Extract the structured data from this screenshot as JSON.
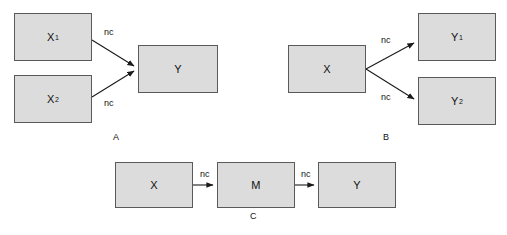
{
  "figure": {
    "background_color": "#ffffff",
    "node_fill": "#dcdcdc",
    "node_border": "#5a5a5a",
    "arrow_color": "#1a1a1a",
    "width": 507,
    "height": 235
  },
  "panels": [
    {
      "id": "A",
      "label": "A",
      "label_x": 113,
      "label_y": 132,
      "description": "two exposures converge on one outcome",
      "nodes": [
        {
          "id": "x1",
          "base": "X",
          "sub": "1",
          "x": 14,
          "y": 13,
          "w": 78,
          "h": 48
        },
        {
          "id": "x2",
          "base": "X",
          "sub": "2",
          "x": 14,
          "y": 75,
          "w": 78,
          "h": 48
        },
        {
          "id": "y",
          "base": "Y",
          "sub": "",
          "x": 138,
          "y": 45,
          "w": 80,
          "h": 48
        }
      ],
      "edges": [
        {
          "from": "x1",
          "to": "y",
          "label": "nc",
          "label_x": 104,
          "label_y": 27
        },
        {
          "from": "x2",
          "to": "y",
          "label": "nc",
          "label_x": 104,
          "label_y": 98
        }
      ]
    },
    {
      "id": "B",
      "label": "B",
      "label_x": 383,
      "label_y": 132,
      "description": "one exposure diverges to two outcomes",
      "nodes": [
        {
          "id": "x",
          "base": "X",
          "sub": "",
          "x": 288,
          "y": 45,
          "w": 78,
          "h": 48
        },
        {
          "id": "y1",
          "base": "Y",
          "sub": "1",
          "x": 418,
          "y": 13,
          "w": 78,
          "h": 48
        },
        {
          "id": "y2",
          "base": "Y",
          "sub": "2",
          "x": 418,
          "y": 77,
          "w": 78,
          "h": 48
        }
      ],
      "edges": [
        {
          "from": "x",
          "to": "y1",
          "label": "nc",
          "label_x": 381,
          "label_y": 35
        },
        {
          "from": "x",
          "to": "y2",
          "label": "nc",
          "label_x": 381,
          "label_y": 92
        }
      ]
    },
    {
      "id": "C",
      "label": "C",
      "label_x": 250,
      "label_y": 211,
      "description": "exposure acts through a mediator on the outcome",
      "nodes": [
        {
          "id": "x",
          "base": "X",
          "sub": "",
          "x": 115,
          "y": 162,
          "w": 78,
          "h": 46
        },
        {
          "id": "m",
          "base": "M",
          "sub": "",
          "x": 217,
          "y": 162,
          "w": 78,
          "h": 46
        },
        {
          "id": "y",
          "base": "Y",
          "sub": "",
          "x": 318,
          "y": 162,
          "w": 78,
          "h": 46
        }
      ],
      "edges": [
        {
          "from": "x",
          "to": "m",
          "label": "nc",
          "label_x": 200,
          "label_y": 169
        },
        {
          "from": "m",
          "to": "y",
          "label": "nc",
          "label_x": 301,
          "label_y": 169
        }
      ]
    }
  ],
  "arrows": [
    {
      "name": "a-x1-to-y",
      "x1": 92,
      "y1": 40,
      "x2": 134,
      "y2": 66
    },
    {
      "name": "a-x2-to-y",
      "x1": 92,
      "y1": 97,
      "x2": 134,
      "y2": 71
    },
    {
      "name": "b-x-to-y1",
      "x1": 366,
      "y1": 69,
      "x2": 414,
      "y2": 43
    },
    {
      "name": "b-x-to-y2",
      "x1": 366,
      "y1": 69,
      "x2": 414,
      "y2": 99
    },
    {
      "name": "c-x-to-m",
      "x1": 193,
      "y1": 185,
      "x2": 213,
      "y2": 185
    },
    {
      "name": "c-m-to-y",
      "x1": 295,
      "y1": 185,
      "x2": 314,
      "y2": 185
    }
  ]
}
